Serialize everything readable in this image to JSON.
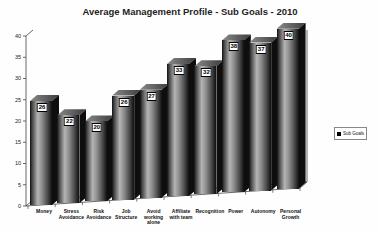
{
  "chart_data": {
    "type": "bar",
    "projection": "3d",
    "title": "Average Management Profile - Sub Goals - 2010",
    "categories": [
      "Money",
      "Stress Avoidance",
      "Risk Avoidance",
      "Job Structure",
      "Avoid working alone",
      "Affiliate with team",
      "Recognition",
      "Power",
      "Autonomy",
      "Personal Growth"
    ],
    "series": [
      {
        "name": "Sub Goals",
        "values": [
          26,
          22,
          20,
          26,
          27,
          33,
          32,
          38,
          37,
          40
        ]
      }
    ],
    "xlabel": "",
    "ylabel": "",
    "ylim": [
      0,
      40
    ],
    "yticks": [
      0,
      5,
      10,
      15,
      20,
      25,
      30,
      35,
      40
    ],
    "grid": false,
    "legend_position": "right",
    "value_labels_shown": true
  },
  "legend": {
    "label": "Sub Goals",
    "marker": "black-square"
  },
  "colors": {
    "bar_edge": "#0f0f0f",
    "bar_shine": "#b5b5b5",
    "bar_mid": "#8c8c8c",
    "bar_top_light": "#8a8a8a",
    "bar_top_dark": "#3c3c3c",
    "bar_side": "#0e0e0e",
    "axis": "#444444",
    "title_text": "#1f1f1f",
    "label_box_bg": "#ffffff",
    "label_box_border": "#000000"
  }
}
